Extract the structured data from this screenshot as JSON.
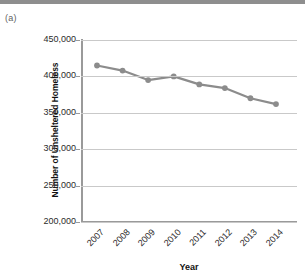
{
  "figure": {
    "panel_label": "(a)"
  },
  "chart_data": {
    "type": "line",
    "title": "",
    "subtitle": "",
    "xlabel": "Year",
    "ylabel": "Number of Unsheltered Homeless",
    "categories": [
      "2007",
      "2008",
      "2009",
      "2010",
      "2011",
      "2012",
      "2013",
      "2014"
    ],
    "values": [
      415000,
      408000,
      395000,
      400000,
      389000,
      384000,
      370000,
      362000
    ],
    "series": [
      {
        "name": "Unsheltered Homeless",
        "values": [
          415000,
          408000,
          395000,
          400000,
          389000,
          384000,
          370000,
          362000
        ]
      }
    ],
    "ylim": [
      200000,
      450000
    ],
    "ytick_values": [
      450000,
      400000,
      350000,
      300000,
      250000,
      200000
    ],
    "ytick_labels": [
      "450,000",
      "400,000",
      "350,000",
      "300,000",
      "250,000",
      "200,000"
    ],
    "xtick_labels": [
      "2007",
      "2008",
      "2009",
      "2010",
      "2011",
      "2012",
      "2013",
      "2014"
    ],
    "grid": true,
    "grid_axis": "y",
    "legend": false,
    "legend_position": "none",
    "marker": "circle",
    "line_color": "#8c8c8c",
    "marker_color": "#8c8c8c",
    "gridline_color": "#c9c9c9",
    "axis_color": "#9a9a9a",
    "background_color": "#ffffff"
  }
}
